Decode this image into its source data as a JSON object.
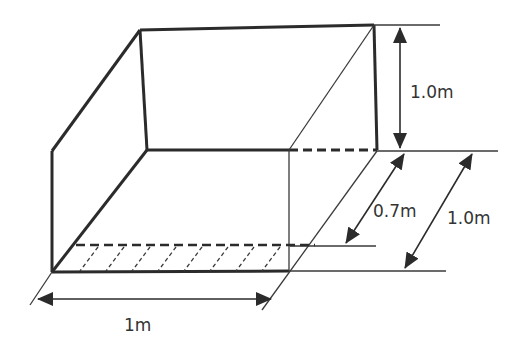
{
  "diagram": {
    "type": "open-box-tank-with-dimensions",
    "colors": {
      "line": "#2b2b2b",
      "thin_line": "#3a3a3a",
      "label": "#333333",
      "background": "#ffffff"
    },
    "labels": {
      "height_upper": "1.0m",
      "depth_water": "0.7m",
      "depth_total": "1.0m",
      "width": "1m"
    },
    "dimensions": [
      {
        "name": "upper-height",
        "value": "1.0m",
        "orientation": "vertical"
      },
      {
        "name": "water-depth",
        "value": "0.7m",
        "orientation": "diagonal"
      },
      {
        "name": "total-depth",
        "value": "1.0m",
        "orientation": "diagonal"
      },
      {
        "name": "base-width",
        "value": "1m",
        "orientation": "horizontal"
      }
    ],
    "features": [
      "hatched water-level strip",
      "dashed hidden edges"
    ]
  }
}
